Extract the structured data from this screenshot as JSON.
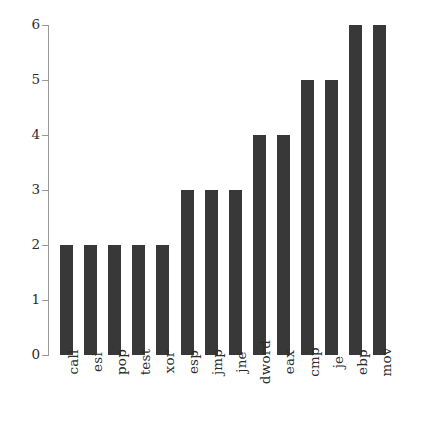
{
  "chart_data": {
    "type": "bar",
    "title": "",
    "subtitle": "",
    "xlabel": "",
    "ylabel": "",
    "categories": [
      "call",
      "esi",
      "pop",
      "test",
      "xor",
      "esp",
      "jmp",
      "jne",
      "dword",
      "eax",
      "cmp",
      "je",
      "ebp",
      "mov"
    ],
    "values": [
      2,
      2,
      2,
      2,
      2,
      3,
      3,
      3,
      4,
      4,
      5,
      5,
      6,
      6
    ],
    "ylim": [
      0,
      6
    ],
    "yticks": [
      0,
      1,
      2,
      3,
      4,
      5,
      6
    ],
    "ytick_labels": [
      "0",
      "1",
      "2",
      "3",
      "4",
      "5",
      "6"
    ],
    "grid": false,
    "legend": null,
    "legend_position": "none",
    "annotations": [],
    "bar_color": "#383838",
    "axis_color": "#9a9a9a",
    "text_color": "#2b2b2b",
    "background": "#ffffff",
    "xtick_rotation": 90
  }
}
